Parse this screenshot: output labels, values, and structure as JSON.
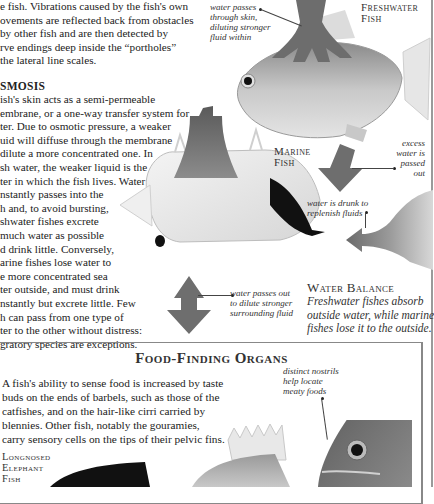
{
  "intro_paragraph": {
    "lines": [
      "e fish. Vibrations caused by the fish's own",
      "ovements are reflected back from obstacles",
      "by other fish and are then detected by",
      "rve endings deep inside the “portholes”",
      "the lateral line scales."
    ]
  },
  "osmosis": {
    "heading": "SMOSIS",
    "lines": [
      "ish's skin acts as a semi-permeable",
      "embrane, or a one-way transfer system for",
      "ter. Due to osmotic pressure, a weaker",
      "uid will diffuse through the membrane",
      "dilute a more concentrated one. In",
      "sh water, the weaker liquid is the",
      "ter in which the fish lives. Water",
      "nstantly passes into the",
      "h and, to avoid bursting,",
      "shwater fishes excrete",
      "much water as possible",
      "d drink little. Conversely,",
      "arine fishes lose water to",
      "e more concentrated sea",
      "ter outside, and must drink",
      "nstantly but excrete little. Few",
      "h can pass from one type of",
      "ter to the other without distress:",
      "gratory species are exceptions."
    ]
  },
  "diagram": {
    "freshwater_label": [
      "Freshwater",
      "Fish"
    ],
    "marine_label": [
      "Marine",
      "Fish"
    ],
    "captions": {
      "water_passes_skin": [
        "water passes",
        "through skin,",
        "diluting stronger",
        "fluid within"
      ],
      "excess_water": [
        "excess",
        "water is",
        "passed",
        "out"
      ],
      "water_drunk": [
        "water is drunk to",
        "replenish fluids"
      ],
      "water_passes_out": [
        "water passes out",
        "to dilute stronger",
        "surrounding fluid"
      ]
    },
    "arrow_color": "#6e6e6e"
  },
  "water_balance": {
    "title": "Water Balance",
    "lines": [
      "Freshwater fishes absorb",
      "outside water, while marine",
      "fishes lose it to the outside."
    ]
  },
  "food_finding": {
    "title": "Food-Finding Organs",
    "lines": [
      "A fish's ability to sense food is increased by taste",
      "buds on the ends of barbels, such as those of the",
      "catfishes, and on the hair-like cirri carried by",
      "blennies. Other fish, notably the gouramies,",
      "carry sensory cells on the tips of their pelvic fins."
    ],
    "nostrils_caption": [
      "distinct nostrils",
      "help locate",
      "meaty foods"
    ],
    "elephant_fish_label": [
      "Longnosed",
      "Elephant",
      "Fish"
    ]
  }
}
